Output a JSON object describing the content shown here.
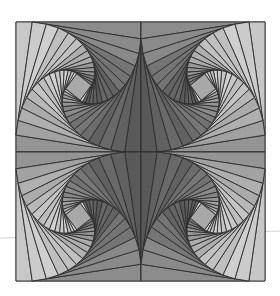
{
  "artwork": {
    "title": "Twisted squares quilt pattern",
    "canvas": {
      "width": 280,
      "height": 296,
      "background": "#ffffff"
    },
    "guide_line": {
      "x1": 0,
      "y1": 238,
      "x2": 280,
      "y2": 231,
      "color": "#d0d0d0"
    },
    "outline_color": "#2e2e2e",
    "outline_width": 0.9,
    "levels": 15,
    "twist_ratio": 0.13,
    "shade": {
      "base": 150,
      "amp": 55,
      "min": 70,
      "max": 225
    },
    "center_fill": "#a8a8a8",
    "highlight_fill": "#dcdcdc",
    "blocks": [
      {
        "name": "top-left",
        "x": 16,
        "y": 22,
        "w": 125,
        "h": 130,
        "mirror": false,
        "phase": 200
      },
      {
        "name": "top-right",
        "x": 141,
        "y": 22,
        "w": 124,
        "h": 130,
        "mirror": true,
        "phase": 340
      },
      {
        "name": "bottom-left",
        "x": 16,
        "y": 152,
        "w": 125,
        "h": 129,
        "mirror": true,
        "phase": 160
      },
      {
        "name": "bottom-right",
        "x": 141,
        "y": 152,
        "w": 124,
        "h": 129,
        "mirror": false,
        "phase": 20
      }
    ]
  }
}
